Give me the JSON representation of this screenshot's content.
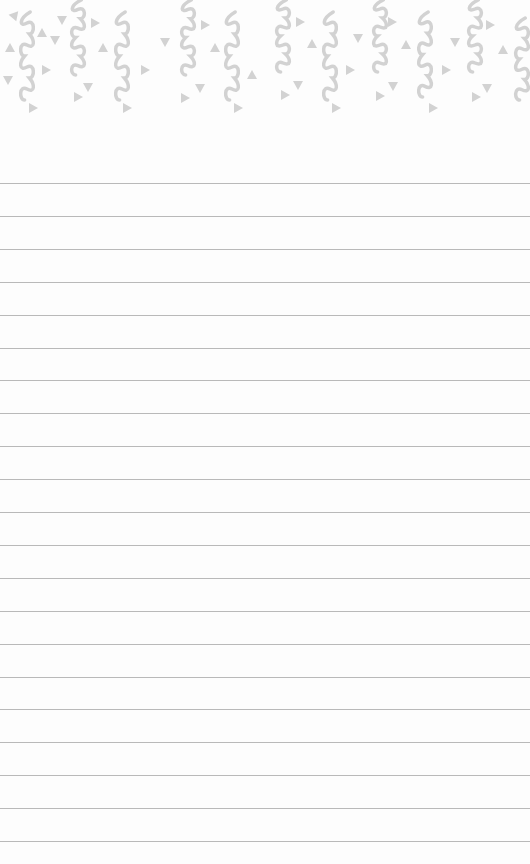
{
  "page": {
    "type": "ruled-notepad",
    "background_color": "#fdfdfd",
    "rule_color": "#b9b9b9",
    "pattern_color": "#d2d2d2"
  },
  "header": {
    "decoration": "confetti-squiggles-and-triangles",
    "squiggles": [
      {
        "x": 27,
        "y": 12,
        "len": 88
      },
      {
        "x": 78,
        "y": 0,
        "len": 75
      },
      {
        "x": 122,
        "y": 12,
        "len": 88
      },
      {
        "x": 188,
        "y": 0,
        "len": 75
      },
      {
        "x": 232,
        "y": 12,
        "len": 88
      },
      {
        "x": 283,
        "y": 0,
        "len": 72
      },
      {
        "x": 330,
        "y": 12,
        "len": 88
      },
      {
        "x": 380,
        "y": 0,
        "len": 72
      },
      {
        "x": 425,
        "y": 12,
        "len": 85
      },
      {
        "x": 475,
        "y": 0,
        "len": 72
      },
      {
        "x": 522,
        "y": 18,
        "len": 82
      }
    ],
    "triangles": [
      {
        "x": 10,
        "y": 48,
        "r": 0
      },
      {
        "x": 15,
        "y": 15,
        "r": 40
      },
      {
        "x": 42,
        "y": 33,
        "r": 0
      },
      {
        "x": 55,
        "y": 40,
        "r": 180
      },
      {
        "x": 46,
        "y": 70,
        "r": 90
      },
      {
        "x": 33,
        "y": 108,
        "r": 90
      },
      {
        "x": 62,
        "y": 20,
        "r": 180
      },
      {
        "x": 95,
        "y": 23,
        "r": 90
      },
      {
        "x": 103,
        "y": 48,
        "r": 0
      },
      {
        "x": 88,
        "y": 87,
        "r": 180
      },
      {
        "x": 78,
        "y": 97,
        "r": 90
      },
      {
        "x": 8,
        "y": 80,
        "r": 180
      },
      {
        "x": 127,
        "y": 108,
        "r": 90
      },
      {
        "x": 145,
        "y": 70,
        "r": 90
      },
      {
        "x": 165,
        "y": 42,
        "r": 180
      },
      {
        "x": 205,
        "y": 25,
        "r": 90
      },
      {
        "x": 215,
        "y": 48,
        "r": 0
      },
      {
        "x": 200,
        "y": 88,
        "r": 180
      },
      {
        "x": 185,
        "y": 98,
        "r": 90
      },
      {
        "x": 238,
        "y": 108,
        "r": 90
      },
      {
        "x": 252,
        "y": 75,
        "r": 0
      },
      {
        "x": 300,
        "y": 22,
        "r": 90
      },
      {
        "x": 312,
        "y": 44,
        "r": 0
      },
      {
        "x": 298,
        "y": 85,
        "r": 180
      },
      {
        "x": 285,
        "y": 95,
        "r": 90
      },
      {
        "x": 336,
        "y": 108,
        "r": 90
      },
      {
        "x": 350,
        "y": 70,
        "r": 90
      },
      {
        "x": 358,
        "y": 38,
        "r": 180
      },
      {
        "x": 392,
        "y": 22,
        "r": 90
      },
      {
        "x": 406,
        "y": 45,
        "r": 0
      },
      {
        "x": 393,
        "y": 86,
        "r": 180
      },
      {
        "x": 380,
        "y": 96,
        "r": 90
      },
      {
        "x": 433,
        "y": 108,
        "r": 90
      },
      {
        "x": 446,
        "y": 70,
        "r": 90
      },
      {
        "x": 455,
        "y": 42,
        "r": 180
      },
      {
        "x": 490,
        "y": 25,
        "r": 90
      },
      {
        "x": 503,
        "y": 50,
        "r": 0
      },
      {
        "x": 487,
        "y": 88,
        "r": 180
      },
      {
        "x": 476,
        "y": 97,
        "r": 90
      }
    ]
  },
  "ruled_lines": {
    "first_y": 183,
    "spacing": 32.9,
    "count": 21
  }
}
